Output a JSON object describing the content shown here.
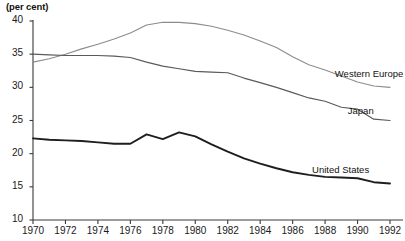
{
  "chart_data": {
    "type": "line",
    "title": "",
    "subtitle": "",
    "unit_label": "(per cent)",
    "xlabel": "",
    "ylabel": "",
    "xlim": [
      1970,
      1992
    ],
    "ylim": [
      10,
      40
    ],
    "grid": false,
    "legend_position": "inline-right",
    "y_ticks": [
      40,
      35,
      30,
      25,
      20,
      15,
      10
    ],
    "x_ticks": [
      1970,
      1972,
      1974,
      1976,
      1978,
      1980,
      1982,
      1984,
      1986,
      1988,
      1990,
      1992
    ],
    "x": [
      1970,
      1971,
      1972,
      1973,
      1974,
      1975,
      1976,
      1977,
      1978,
      1979,
      1980,
      1981,
      1982,
      1983,
      1984,
      1985,
      1986,
      1987,
      1988,
      1989,
      1990,
      1991,
      1992
    ],
    "series": [
      {
        "name": "Western Europe",
        "color": "#8c8c8c",
        "width": 1.1,
        "label_x": 1988.6,
        "label_y": 32.0,
        "values": [
          33.8,
          34.3,
          35.0,
          35.8,
          36.5,
          37.3,
          38.2,
          39.4,
          39.8,
          39.8,
          39.6,
          39.2,
          38.6,
          37.9,
          37.0,
          36.0,
          34.6,
          33.4,
          32.6,
          31.7,
          30.8,
          30.2,
          30.0
        ]
      },
      {
        "name": "Japan",
        "color": "#5a5a5a",
        "width": 1.2,
        "label_x": 1989.4,
        "label_y": 26.4,
        "values": [
          35.0,
          34.9,
          34.8,
          34.8,
          34.8,
          34.7,
          34.5,
          33.8,
          33.2,
          32.8,
          32.4,
          32.3,
          32.2,
          31.4,
          30.7,
          30.0,
          29.2,
          28.4,
          27.9,
          27.0,
          26.7,
          25.2,
          25.0
        ]
      },
      {
        "name": "United States",
        "color": "#1e1e1e",
        "width": 1.9,
        "label_x": 1987.2,
        "label_y": 17.6,
        "values": [
          22.3,
          22.1,
          22.0,
          21.9,
          21.7,
          21.5,
          21.5,
          22.9,
          22.2,
          23.2,
          22.6,
          21.4,
          20.3,
          19.3,
          18.5,
          17.8,
          17.2,
          16.8,
          16.5,
          16.4,
          16.3,
          15.7,
          15.5
        ]
      }
    ]
  },
  "axes": {
    "axis_color": "#3a3a3a",
    "tick_color": "#3a3a3a"
  }
}
